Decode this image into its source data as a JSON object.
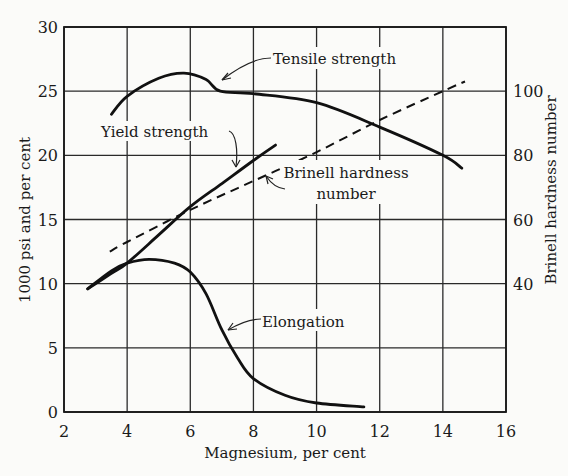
{
  "chart_data": {
    "type": "line",
    "title": "",
    "xlabel": "Magnesium, per cent",
    "ylabel": "1000 psi and per cent",
    "ylabel_right": "Brinell hardness number",
    "xlim": [
      2,
      16
    ],
    "ylim": [
      0,
      30
    ],
    "ylim_right": [
      0,
      120
    ],
    "x_ticks": [
      2,
      4,
      6,
      8,
      10,
      12,
      14,
      16
    ],
    "y_ticks": [
      0,
      5,
      10,
      15,
      20,
      25,
      30
    ],
    "y_ticks_right": [
      40,
      60,
      80,
      100
    ],
    "grid": true,
    "legend": "inline annotations with arrows",
    "series": [
      {
        "name": "Tensile strength",
        "axis": "left",
        "style": "solid",
        "x": [
          3.5,
          4.0,
          5.0,
          5.8,
          6.5,
          6.95,
          8.0,
          10.0,
          12.0,
          14.0,
          14.6
        ],
        "y": [
          23.2,
          24.6,
          26.0,
          26.4,
          25.9,
          25.0,
          24.8,
          24.1,
          22.2,
          20.0,
          19.0
        ]
      },
      {
        "name": "Yield strength",
        "axis": "left",
        "style": "solid",
        "x": [
          2.75,
          3.5,
          4.0,
          5.0,
          6.0,
          7.0,
          8.0,
          8.7
        ],
        "y": [
          9.6,
          10.8,
          11.6,
          13.8,
          16.0,
          17.8,
          19.6,
          20.8
        ]
      },
      {
        "name": "Brinell hardness number",
        "axis": "right",
        "style": "dashed",
        "x": [
          3.45,
          4.0,
          6.0,
          8.0,
          10.0,
          12.0,
          14.0,
          14.7
        ],
        "y": [
          50,
          53,
          63,
          72,
          81,
          91,
          100,
          103
        ]
      },
      {
        "name": "Elongation",
        "axis": "left",
        "style": "solid",
        "x": [
          2.75,
          3.5,
          4.0,
          4.7,
          5.5,
          6.0,
          6.5,
          7.0,
          7.5,
          8.0,
          9.0,
          10.0,
          11.5
        ],
        "y": [
          9.6,
          11.0,
          11.6,
          11.9,
          11.6,
          10.9,
          9.2,
          6.4,
          4.2,
          2.6,
          1.3,
          0.7,
          0.4
        ]
      }
    ],
    "annotations": [
      {
        "text": "Tensile strength",
        "target": "Tensile strength"
      },
      {
        "text": "Yield strength",
        "target": "Yield strength"
      },
      {
        "text": "Brinell hardness",
        "text2": "number",
        "target": "Brinell hardness number"
      },
      {
        "text": "Elongation",
        "target": "Elongation"
      }
    ]
  },
  "labels": {
    "xlabel": "Magnesium, per cent",
    "ylabel": "1000 psi and per cent",
    "ylabel_right": "Brinell hardness number",
    "tensile": "Tensile strength",
    "yield": "Yield strength",
    "brinell_1": "Brinell hardness",
    "brinell_2": "number",
    "elongation": "Elongation"
  },
  "ticks": {
    "x": [
      "2",
      "4",
      "6",
      "8",
      "10",
      "12",
      "14",
      "16"
    ],
    "y": [
      "0",
      "5",
      "10",
      "15",
      "20",
      "25",
      "30"
    ],
    "y_right": [
      "40",
      "60",
      "80",
      "100"
    ]
  }
}
